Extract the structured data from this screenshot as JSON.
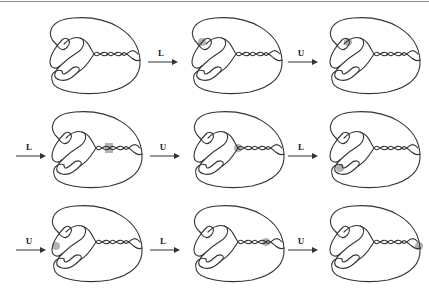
{
  "figure": {
    "rows": [
      {
        "cells": [
          {
            "highlight": "none"
          },
          {
            "incoming_label": "L",
            "highlight": "upper-left-crossing"
          },
          {
            "incoming_label": "U",
            "highlight": "upper-left-inner-crossing"
          }
        ]
      },
      {
        "cells": [
          {
            "incoming_label": "L",
            "highlight": "twist-crossing-2"
          },
          {
            "incoming_label": "U",
            "highlight": "twist-crossing-1"
          },
          {
            "incoming_label": "L",
            "highlight": "lower-left-crossing"
          }
        ]
      },
      {
        "cells": [
          {
            "incoming_label": "U",
            "highlight": "left-middle-crossing"
          },
          {
            "incoming_label": "L",
            "highlight": "twist-crossing-3"
          },
          {
            "incoming_label": "U",
            "highlight": "right-crossing"
          }
        ]
      }
    ]
  },
  "arrows": [
    {
      "label": "L"
    },
    {
      "label": "U"
    },
    {
      "label": "L"
    },
    {
      "label": "U"
    },
    {
      "label": "L"
    },
    {
      "label": "U"
    },
    {
      "label": "L"
    },
    {
      "label": "U"
    }
  ],
  "colors": {
    "stroke": "#333333",
    "highlight": "#9a9a9a",
    "rule": "#8a8a8a"
  }
}
